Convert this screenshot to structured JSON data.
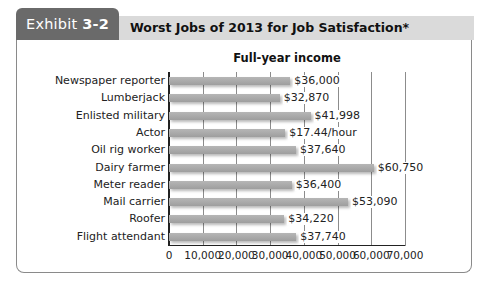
{
  "header": {
    "exhibit_prefix": "Exhibit",
    "exhibit_number": "3-2",
    "title": "Worst Jobs of 2013 for Job Satisfaction*"
  },
  "colors": {
    "tab": "#6a6a6a",
    "title_bar": "#dadada",
    "bar": "#a8a8a8",
    "gridline": "#8c8c8c"
  },
  "chart_data": {
    "type": "bar",
    "orientation": "horizontal",
    "title": "Full-year income",
    "xlabel": "",
    "ylabel": "",
    "xlim": [
      0,
      70000
    ],
    "grid": true,
    "legend": null,
    "categories": [
      "Newspaper reporter",
      "Lumberjack",
      "Enlisted military",
      "Actor",
      "Oil rig worker",
      "Dairy farmer",
      "Meter reader",
      "Mail carrier",
      "Roofer",
      "Flight attendant"
    ],
    "values": [
      36000,
      32870,
      41998,
      34500,
      37640,
      60750,
      36400,
      53090,
      34220,
      37740
    ],
    "data_labels": [
      "$36,000",
      "$32,870",
      "$41,998",
      "$17.44/hour",
      "$37,640",
      "$60,750",
      "$36,400",
      "$53,090",
      "$34,220",
      "$37,740"
    ],
    "x_ticks": [
      0,
      10000,
      20000,
      30000,
      40000,
      50000,
      60000,
      70000
    ],
    "x_tick_labels": [
      "0",
      "10,000",
      "20,000",
      "30,000",
      "40,000",
      "50,000",
      "60,000",
      "70,000"
    ]
  }
}
